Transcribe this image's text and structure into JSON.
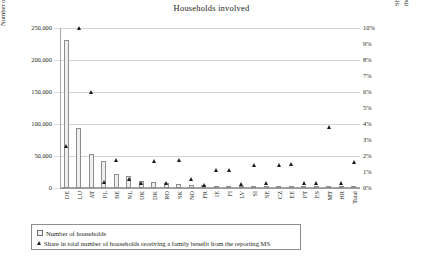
{
  "chart_data": {
    "type": "bar",
    "title": "Households involved",
    "xlabel": "",
    "ylabel": "Number of households residing in another MS",
    "ylabel_right": "Share in total number of households receiving a family benefit from the reporting MS",
    "ylim": [
      0,
      250000
    ],
    "ylim_right": [
      0,
      10
    ],
    "yticks": [
      "0",
      "50,000",
      "100,000",
      "150,000",
      "200,000",
      "250,000"
    ],
    "yticks_right": [
      "0%",
      "1%",
      "2%",
      "3%",
      "4%",
      "5%",
      "6%",
      "7%",
      "8%",
      "9%",
      "10%"
    ],
    "grid": true,
    "legend_position": "bottom-left",
    "categories": [
      "DE",
      "LU",
      "AT",
      "PL",
      "BE",
      "NL",
      "UK",
      "DK",
      "RO",
      "SK",
      "NO",
      "FR",
      "IE",
      "FI",
      "LV",
      "SI",
      "SE",
      "CZ",
      "EE",
      "PT",
      "ES",
      "MT",
      "HR",
      "Total"
    ],
    "series": [
      {
        "name": "Number of households",
        "marker": "square",
        "axis": "left",
        "values": [
          232000,
          94000,
          53000,
          42000,
          22000,
          19000,
          11000,
          9500,
          8000,
          6500,
          5200,
          4600,
          3600,
          3100,
          2500,
          2100,
          1700,
          1400,
          1100,
          900,
          700,
          600,
          450,
          1200
        ]
      },
      {
        "name": "Share in total number of households receiving a family benefit from the reporting MS",
        "marker": "triangle",
        "axis": "right",
        "values": [
          2.6,
          10.0,
          6.0,
          0.35,
          1.75,
          0.55,
          0.3,
          1.7,
          0.3,
          1.75,
          0.55,
          0.2,
          1.1,
          1.1,
          0.25,
          1.45,
          0.3,
          1.45,
          1.5,
          0.3,
          0.3,
          3.8,
          0.3,
          1.6
        ]
      }
    ],
    "legend": [
      {
        "marker": "square",
        "label": "Number of households"
      },
      {
        "marker": "triangle",
        "label": "Share in total number of households receiving a family benefit from the reporting MS"
      }
    ]
  }
}
